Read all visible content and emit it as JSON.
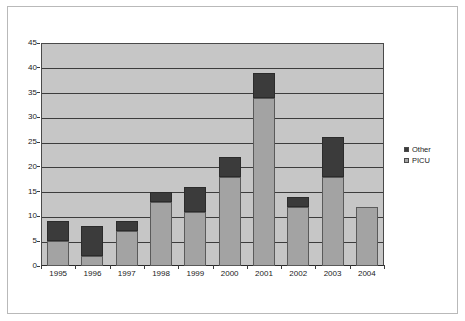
{
  "chart_data": {
    "type": "bar",
    "stacked": true,
    "title": "",
    "subtitle": "",
    "xlabel": "",
    "ylabel": "",
    "categories": [
      "1995",
      "1996",
      "1997",
      "1998",
      "1999",
      "2000",
      "2001",
      "2002",
      "2003",
      "2004"
    ],
    "series": [
      {
        "name": "PICU",
        "color": "#a3a3a3",
        "values": [
          5,
          2,
          7,
          13,
          11,
          18,
          34,
          12,
          18,
          12
        ]
      },
      {
        "name": "Other",
        "color": "#3b3b3b",
        "values": [
          4,
          6,
          2,
          2,
          5,
          4,
          5,
          2,
          8,
          0
        ]
      }
    ],
    "totals": [
      9,
      8,
      9,
      15,
      16,
      22,
      39,
      14,
      26,
      12
    ],
    "ylim": [
      0,
      45
    ],
    "ytick_labels": [
      "0",
      "5",
      "10",
      "15",
      "20",
      "25",
      "30",
      "35",
      "40",
      "45"
    ],
    "ytick_values": [
      0,
      5,
      10,
      15,
      20,
      25,
      30,
      35,
      40,
      45
    ],
    "ytick_step": 5,
    "grid": true,
    "grid_axis": "y",
    "legend_position": "right",
    "legend_entries": [
      {
        "label": "Other",
        "color": "#3b3b3b"
      },
      {
        "label": "PICU",
        "color": "#a3a3a3"
      }
    ],
    "plot_background": "#c6c6c6",
    "figure_background": "#ffffff",
    "gridline_color": "#3c3c3c"
  }
}
